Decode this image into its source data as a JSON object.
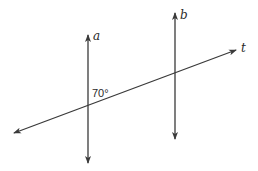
{
  "diagram": {
    "lines": [
      {
        "id": "a",
        "label": "a",
        "type": "vertical",
        "x": 88,
        "y_top": 35,
        "y_bottom": 163,
        "arrows": "both"
      },
      {
        "id": "b",
        "label": "b",
        "type": "vertical",
        "x": 175,
        "y_top": 13,
        "y_bottom": 139,
        "arrows": "both"
      },
      {
        "id": "t",
        "label": "t",
        "type": "transversal",
        "x1": 14,
        "y1": 133,
        "x2": 236,
        "y2": 50,
        "arrows": "both"
      }
    ],
    "angle": {
      "label": "70°",
      "value": 70,
      "location": "upper-right of intersection of a and t"
    },
    "colors": {
      "line": "#3a3a3a",
      "text": "#2a2a2a",
      "background": "#ffffff"
    }
  }
}
